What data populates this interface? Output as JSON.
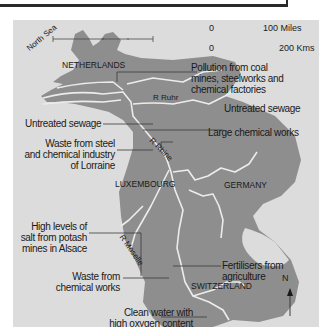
{
  "map": {
    "colors": {
      "background": "#dcdcdc",
      "land": "#8e8e8e",
      "river": "#ececec",
      "frame": "#2a2a2a",
      "text": "#1a1a1a"
    },
    "sea_label": "North Sea",
    "countries": [
      "NETHERLANDS",
      "LUXEMBOURG",
      "GERMANY",
      "SWITZERLAND"
    ],
    "rivers": [
      "R Ruhr",
      "R Rhine",
      "R Moselle"
    ],
    "scale": {
      "miles_zero": "0",
      "miles_label": "100 Miles",
      "kms_zero": "0",
      "kms_label": "200 Kms"
    },
    "north_arrow": "N",
    "annotations": [
      {
        "id": "coal",
        "lines": [
          "Pollution from coal",
          "mines, steelworks and",
          "chemical factories"
        ]
      },
      {
        "id": "sewage-ruhr",
        "lines": [
          "Untreated sewage"
        ]
      },
      {
        "id": "sewage-left",
        "lines": [
          "Untreated sewage"
        ]
      },
      {
        "id": "chemical-works-large",
        "lines": [
          "Large chemical works"
        ]
      },
      {
        "id": "lorraine",
        "lines": [
          "Waste from steel",
          "and chemical industry",
          "of Lorraine"
        ]
      },
      {
        "id": "alsace",
        "lines": [
          "High levels of",
          "salt from potash",
          "mines in Alsace"
        ]
      },
      {
        "id": "fertilisers",
        "lines": [
          "Fertilisers from",
          "agriculture"
        ]
      },
      {
        "id": "chemical-waste",
        "lines": [
          "Waste from",
          "chemical works"
        ]
      },
      {
        "id": "clean-water",
        "lines": [
          "Clean water with",
          "high oxygen content"
        ]
      }
    ]
  }
}
